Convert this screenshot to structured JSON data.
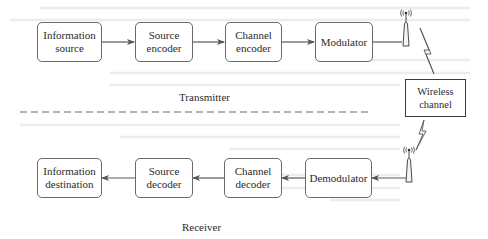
{
  "diagram": {
    "type": "block-diagram",
    "colors": {
      "line": "#5a5a5a",
      "box_border": "#6a6a6a",
      "text": "#2a2a2a",
      "background": "#ffffff"
    },
    "transmitter": {
      "label": "Transmitter",
      "blocks": [
        {
          "id": "info-source",
          "line1": "Information",
          "line2": "source"
        },
        {
          "id": "source-encoder",
          "line1": "Source",
          "line2": "encoder"
        },
        {
          "id": "channel-encoder",
          "line1": "Channel",
          "line2": "encoder"
        },
        {
          "id": "modulator",
          "line1": "Modulator",
          "line2": ""
        }
      ]
    },
    "channel": {
      "line1": "Wireless",
      "line2": "channel"
    },
    "receiver": {
      "label": "Receiver",
      "blocks": [
        {
          "id": "info-destination",
          "line1": "Information",
          "line2": "destination"
        },
        {
          "id": "source-decoder",
          "line1": "Source",
          "line2": "decoder"
        },
        {
          "id": "channel-decoder",
          "line1": "Channel",
          "line2": "decoder"
        },
        {
          "id": "demodulator",
          "line1": "Demodulator",
          "line2": ""
        }
      ]
    },
    "flow": {
      "transmit_path": [
        "Information source",
        "Source encoder",
        "Channel encoder",
        "Modulator",
        "Transmit antenna",
        "Wireless channel"
      ],
      "receive_path": [
        "Wireless channel",
        "Receive antenna",
        "Demodulator",
        "Channel decoder",
        "Source decoder",
        "Information destination"
      ]
    }
  }
}
